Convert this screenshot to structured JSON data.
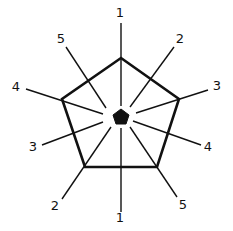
{
  "diagram": {
    "colors": {
      "stroke": "#111111",
      "background": "#ffffff"
    },
    "outer_pentagon": {
      "points": [
        [
          121,
          58
        ],
        [
          179,
          99
        ],
        [
          157,
          167
        ],
        [
          85,
          167
        ],
        [
          62,
          99
        ]
      ],
      "stroke_width": 2.6
    },
    "center_pentagon": {
      "points": [
        [
          121,
          109
        ],
        [
          129,
          115
        ],
        [
          126,
          124
        ],
        [
          116,
          124
        ],
        [
          113,
          115
        ]
      ]
    },
    "rays": [
      {
        "label": "1",
        "from": [
          121,
          23
        ],
        "to": [
          121,
          106
        ],
        "label_pos": [
          120,
          13
        ]
      },
      {
        "label": "5",
        "from": [
          66,
          47
        ],
        "to": [
          106,
          108
        ],
        "label_pos": [
          61,
          39
        ]
      },
      {
        "label": "2",
        "from": [
          174,
          47
        ],
        "to": [
          130,
          107
        ],
        "label_pos": [
          180,
          39
        ]
      },
      {
        "label": "4",
        "from": [
          26,
          89
        ],
        "to": [
          103,
          114
        ],
        "label_pos": [
          16,
          87
        ]
      },
      {
        "label": "3",
        "from": [
          208,
          90
        ],
        "to": [
          136,
          113
        ],
        "label_pos": [
          217,
          86
        ]
      },
      {
        "label": "3",
        "from": [
          42,
          145
        ],
        "to": [
          103,
          122
        ],
        "label_pos": [
          33,
          147
        ]
      },
      {
        "label": "4",
        "from": [
          201,
          145
        ],
        "to": [
          133,
          121
        ],
        "label_pos": [
          208,
          147
        ]
      },
      {
        "label": "2",
        "from": [
          62,
          199
        ],
        "to": [
          111,
          127
        ],
        "label_pos": [
          55,
          206
        ]
      },
      {
        "label": "5",
        "from": [
          177,
          197
        ],
        "to": [
          130,
          127
        ],
        "label_pos": [
          183,
          205
        ]
      },
      {
        "label": "1",
        "from": [
          121,
          212
        ],
        "to": [
          121,
          128
        ],
        "label_pos": [
          120,
          218
        ]
      }
    ]
  }
}
